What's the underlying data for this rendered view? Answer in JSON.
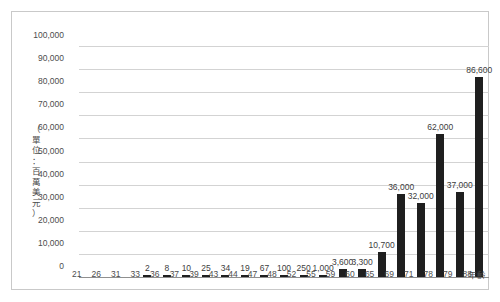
{
  "chart_data": {
    "type": "bar",
    "title": "",
    "subtitle": "",
    "xlabel": "年齡",
    "ylabel": "（單位：百萬美元）",
    "ylabel_chars": [
      "（",
      "單",
      "位",
      "：",
      "百",
      "萬",
      "美",
      "元",
      "）"
    ],
    "categories": [
      "21",
      "26",
      "31",
      "33",
      "36",
      "37",
      "39",
      "43",
      "44",
      "47",
      "48",
      "52",
      "55",
      "59",
      "60",
      "65",
      "69",
      "71",
      "78",
      "79",
      "88"
    ],
    "values": [
      0,
      0,
      0,
      2,
      8,
      10,
      25,
      34,
      19,
      67,
      100,
      250,
      1000,
      3600,
      3300,
      10700,
      36000,
      32000,
      62000,
      37000,
      86600
    ],
    "value_labels": [
      "",
      "",
      "",
      "2",
      "8",
      "10",
      "25",
      "34",
      "19",
      "67",
      "100",
      "250",
      "1,000",
      "3,600",
      "3,300",
      "10,700",
      "36,000",
      "32,000",
      "62,000",
      "37,000",
      "86,600"
    ],
    "ylim": [
      0,
      100000
    ],
    "ytick_values": [
      0,
      10000,
      20000,
      30000,
      40000,
      50000,
      60000,
      70000,
      80000,
      90000,
      100000
    ],
    "ytick_labels": [
      "0",
      "10,000",
      "20,000",
      "30,000",
      "40,000",
      "50,000",
      "60,000",
      "70,000",
      "80,000",
      "90,000",
      "100,000"
    ],
    "grid": true,
    "legend": false,
    "bar_color": "#1f1f1f",
    "grid_color": "#d3d3d3",
    "axis_color": "#8f8f8f",
    "text_color": "#4d4d4d"
  }
}
